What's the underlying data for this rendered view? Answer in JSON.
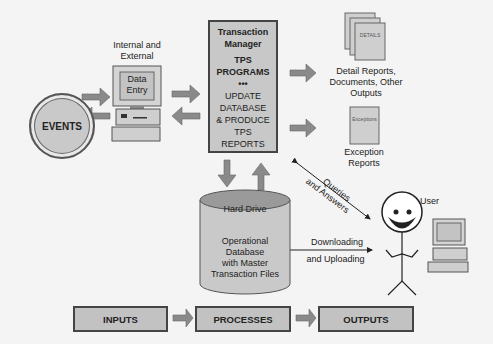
{
  "diagram": {
    "nodes": {
      "events": "EVENTS",
      "entry_caption": [
        "Internal and",
        "External"
      ],
      "data_entry_screen": [
        "Data",
        "Entry"
      ],
      "transaction_manager": {
        "title": [
          "Transaction",
          "Manager"
        ],
        "programs": [
          "TPS",
          "PROGRAMS"
        ],
        "separator": "•••",
        "tasks": [
          "UPDATE",
          "DATABASE",
          "& PRODUCE",
          "TPS",
          "REPORTS"
        ]
      },
      "detail_doc_label": "DETAILS",
      "detail_caption": [
        "Detail Reports,",
        "Documents, Other",
        "Outputs"
      ],
      "exception_doc_label": "Exceptions",
      "exception_caption": [
        "Exception",
        "Reports"
      ],
      "hard_drive": "Hard Drive",
      "database": [
        "Operational",
        "Database",
        "with Master",
        "Transaction Files"
      ],
      "user": "User"
    },
    "edges": {
      "queries": [
        "Queries",
        "and Answers"
      ],
      "download": [
        "Downloading",
        "and Uploading"
      ]
    },
    "flow": [
      "INPUTS",
      "PROCESSES",
      "OUTPUTS"
    ]
  },
  "colors": {
    "box_fill": "#c2c2c2",
    "arrow_fill": "#8a8a8a",
    "border": "#444444",
    "background": "#f4f4f4"
  }
}
